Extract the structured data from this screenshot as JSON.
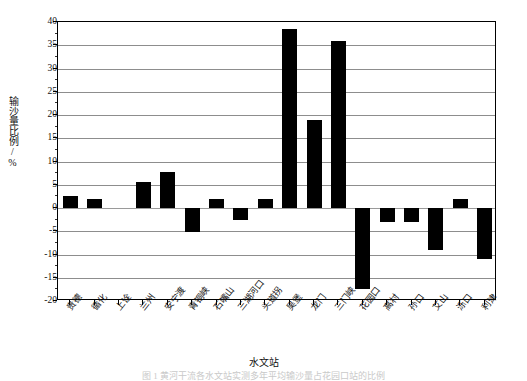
{
  "chart_data": {
    "type": "bar",
    "title": "",
    "xlabel": "水文站",
    "ylabel": "输沙量比例/%",
    "ylim": [
      -20,
      40
    ],
    "ytick_step": 5,
    "grid": true,
    "legend": "none",
    "bar_color": "#000000",
    "categories": [
      "贵德",
      "循化",
      "上诠",
      "兰州",
      "安宁渡",
      "青铜峡",
      "石嘴山",
      "三湖河口",
      "头道拐",
      "吴堡",
      "龙门",
      "三门峡",
      "花园口",
      "高村",
      "孙口",
      "艾山",
      "泺口",
      "利津"
    ],
    "values": [
      2.5,
      2.0,
      0.0,
      5.5,
      7.7,
      -5.2,
      2.0,
      -2.5,
      2.0,
      38.5,
      19.0,
      36.0,
      -17.5,
      -3.0,
      -3.0,
      -9.0,
      2.0,
      -11.0
    ],
    "ytick_labels": [
      "40",
      "35",
      "30",
      "25",
      "20",
      "15",
      "10",
      "5",
      "0",
      "-5",
      "-10",
      "-15",
      "-20"
    ],
    "ytick_values": [
      40,
      35,
      30,
      25,
      20,
      15,
      10,
      5,
      0,
      -5,
      -10,
      -15,
      -20
    ]
  },
  "caption": {
    "text": "图 1 黄河干流各水文站实测多年平均输沙量占花园口站的比例"
  }
}
